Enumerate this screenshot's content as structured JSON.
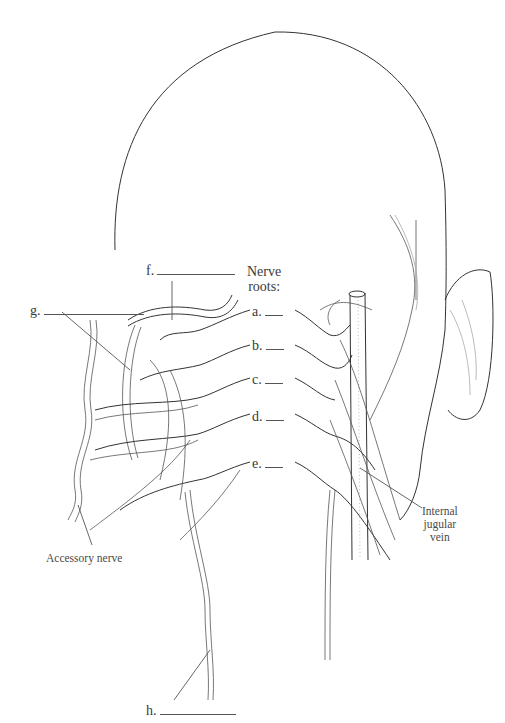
{
  "figure": {
    "title_label": {
      "line1": "Nerve",
      "line2": "roots:"
    },
    "nerve_roots": [
      {
        "id": "a",
        "label": "a."
      },
      {
        "id": "b",
        "label": "b."
      },
      {
        "id": "c",
        "label": "c."
      },
      {
        "id": "d",
        "label": "d."
      },
      {
        "id": "e",
        "label": "e."
      }
    ],
    "blank_labels": [
      {
        "id": "f",
        "label": "f."
      },
      {
        "id": "g",
        "label": "g."
      },
      {
        "id": "h",
        "label": "h."
      }
    ],
    "named_labels": {
      "internal_jugular_vein": {
        "line1": "Internal",
        "line2": "jugular",
        "line3": "vein"
      },
      "accessory_nerve": "Accessory nerve"
    },
    "colors": {
      "ink": "#333333",
      "text": "#3a3a3a",
      "background": "#ffffff"
    }
  }
}
